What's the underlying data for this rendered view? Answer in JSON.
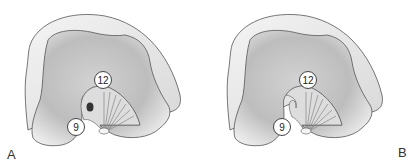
{
  "figure": {
    "panels": [
      {
        "label": "A",
        "markers": [
          {
            "text": "12",
            "x": 94,
            "y": 71
          },
          {
            "text": "9",
            "x": 67,
            "y": 118
          }
        ]
      },
      {
        "label": "B",
        "markers": [
          {
            "text": "12",
            "x": 91,
            "y": 71
          },
          {
            "text": "9",
            "x": 65,
            "y": 118
          }
        ]
      }
    ],
    "colors": {
      "bone_light": "#eeeeee",
      "bone_mid": "#c9c9c9",
      "bone_dark": "#9a9a9a",
      "outline": "#555555"
    }
  }
}
